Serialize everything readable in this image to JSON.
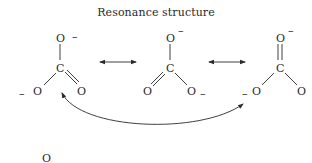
{
  "title": "Resonance structure",
  "atoms": {
    "oxygen": "O",
    "carbon": "C",
    "negative_charge": "–"
  },
  "structures": [
    {
      "name": "resonance-form-1",
      "top_O_charge": "–",
      "left_O_charge": "–",
      "right_O_charge": "",
      "double_bond": "C=O (bottom-right)"
    },
    {
      "name": "resonance-form-2",
      "top_O_charge": "–",
      "left_O_charge": "",
      "right_O_charge": "–",
      "double_bond": "C=O (bottom-left)"
    },
    {
      "name": "resonance-form-3",
      "top_O_charge": "–",
      "left_O_charge": "–",
      "right_O_charge": "",
      "double_bond": "C=O (top)"
    }
  ],
  "arrows": [
    {
      "type": "double-headed",
      "from": "form-1",
      "to": "form-2"
    },
    {
      "type": "double-headed",
      "from": "form-2",
      "to": "form-3"
    },
    {
      "type": "curved-double-headed",
      "from": "form-1",
      "to": "form-3"
    }
  ],
  "partial_bottom_label": "O"
}
